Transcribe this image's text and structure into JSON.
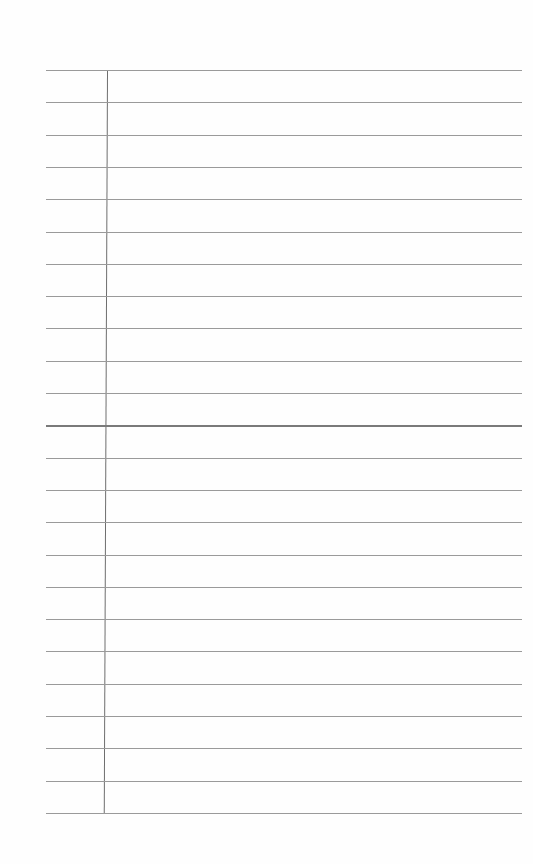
{
  "page": {
    "type": "lined-notebook-paper",
    "rule_count": 24,
    "first_rule_y": 70,
    "rule_spacing": 32.3,
    "rule_left_x": 46,
    "rule_right_x": 522,
    "margin_line_x": 107,
    "colors": {
      "paper": "#fefefe",
      "rule": "#9a9a9a",
      "margin_line": "#6e6e6e"
    }
  }
}
